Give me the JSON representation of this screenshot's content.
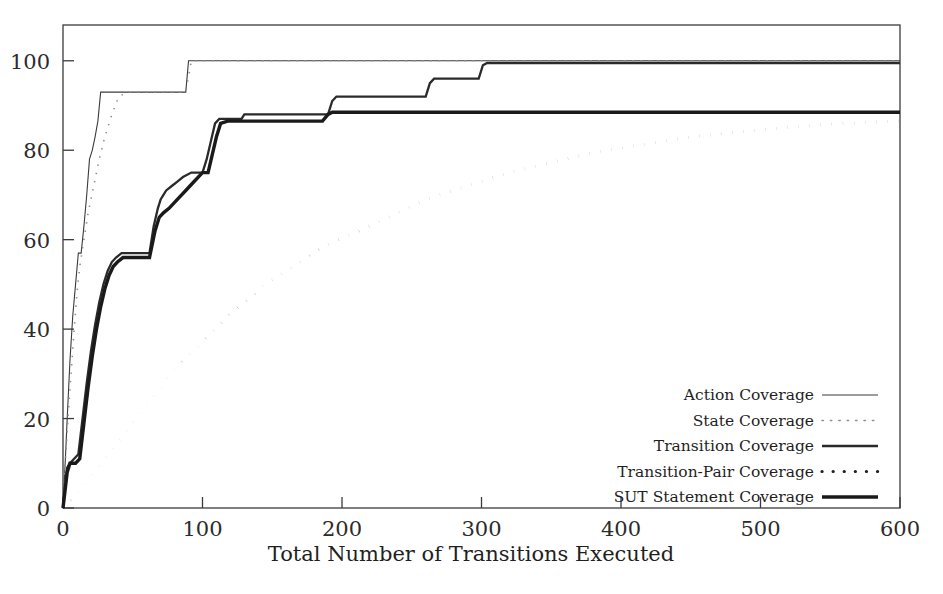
{
  "chart_data": {
    "type": "line",
    "title": "",
    "xlabel": "Total Number of Transitions Executed",
    "ylabel": "",
    "xlim": [
      0,
      600
    ],
    "ylim": [
      0,
      108
    ],
    "xticks": [
      0,
      100,
      200,
      300,
      400,
      500,
      600
    ],
    "yticks": [
      0,
      20,
      40,
      60,
      80,
      100
    ],
    "xtick_labels": [
      "0",
      "100",
      "200",
      "300",
      "400",
      "500",
      "600"
    ],
    "ytick_labels": [
      "0",
      "20",
      "40",
      "60",
      "80",
      "100"
    ],
    "grid": false,
    "legend_position": "lower-right",
    "series": [
      {
        "name": "Action Coverage",
        "style": "thin-solid",
        "color": "#3b3b3b",
        "width": 1.1,
        "dash": "",
        "points": [
          [
            0,
            0
          ],
          [
            2,
            13
          ],
          [
            3,
            20
          ],
          [
            5,
            33
          ],
          [
            7,
            43
          ],
          [
            9,
            50
          ],
          [
            11,
            57
          ],
          [
            13,
            57
          ],
          [
            15,
            63
          ],
          [
            17,
            70
          ],
          [
            19,
            78
          ],
          [
            21,
            80
          ],
          [
            23,
            83
          ],
          [
            25,
            86.5
          ],
          [
            27,
            93
          ],
          [
            88,
            93
          ],
          [
            90,
            100
          ],
          [
            600,
            100
          ]
        ]
      },
      {
        "name": "State Coverage",
        "style": "fine-dotted",
        "color": "#8f8f8f",
        "width": 1.6,
        "dash": "1.4 7",
        "points": [
          [
            0,
            0
          ],
          [
            2,
            12
          ],
          [
            4,
            22
          ],
          [
            6,
            31
          ],
          [
            8,
            40
          ],
          [
            10,
            48
          ],
          [
            12,
            54
          ],
          [
            15,
            60
          ],
          [
            18,
            66
          ],
          [
            22,
            72
          ],
          [
            26,
            78
          ],
          [
            30,
            83
          ],
          [
            35,
            88
          ],
          [
            40,
            92
          ],
          [
            46,
            93
          ],
          [
            88,
            93
          ],
          [
            92,
            100
          ],
          [
            600,
            100
          ]
        ]
      },
      {
        "name": "Transition Coverage",
        "style": "medium-solid",
        "color": "#2a2a2a",
        "width": 2.3,
        "dash": "",
        "points": [
          [
            0,
            0
          ],
          [
            3,
            9
          ],
          [
            5,
            10
          ],
          [
            8,
            11
          ],
          [
            11,
            12
          ],
          [
            14,
            20
          ],
          [
            17,
            28
          ],
          [
            20,
            35
          ],
          [
            23,
            41
          ],
          [
            26,
            46
          ],
          [
            29,
            50
          ],
          [
            32,
            53
          ],
          [
            35,
            55
          ],
          [
            38,
            56
          ],
          [
            42,
            57
          ],
          [
            62,
            57
          ],
          [
            65,
            63
          ],
          [
            68,
            67
          ],
          [
            70,
            69
          ],
          [
            72,
            70
          ],
          [
            74,
            71
          ],
          [
            78,
            72
          ],
          [
            82,
            73
          ],
          [
            86,
            74
          ],
          [
            92,
            75
          ],
          [
            100,
            75
          ],
          [
            103,
            78
          ],
          [
            106,
            82
          ],
          [
            109,
            86
          ],
          [
            112,
            87
          ],
          [
            128,
            87
          ],
          [
            130,
            88
          ],
          [
            190,
            88
          ],
          [
            193,
            91
          ],
          [
            196,
            92
          ],
          [
            260,
            92
          ],
          [
            263,
            95
          ],
          [
            266,
            96
          ],
          [
            298,
            96
          ],
          [
            301,
            99
          ],
          [
            304,
            99.5
          ],
          [
            600,
            99.5
          ]
        ]
      },
      {
        "name": "Transition-Pair Coverage",
        "style": "coarse-dotted",
        "color": "#1f1f1f",
        "width": 3.2,
        "dash": "0.1 11",
        "points": [
          [
            0,
            0
          ],
          [
            10,
            3
          ],
          [
            20,
            7
          ],
          [
            30,
            11
          ],
          [
            40,
            15
          ],
          [
            50,
            19
          ],
          [
            60,
            23
          ],
          [
            70,
            27
          ],
          [
            80,
            31
          ],
          [
            90,
            34
          ],
          [
            100,
            37
          ],
          [
            115,
            42
          ],
          [
            130,
            46
          ],
          [
            145,
            50
          ],
          [
            160,
            53
          ],
          [
            175,
            56
          ],
          [
            190,
            59
          ],
          [
            205,
            61
          ],
          [
            220,
            63
          ],
          [
            240,
            66
          ],
          [
            260,
            69
          ],
          [
            280,
            71
          ],
          [
            300,
            73
          ],
          [
            320,
            75
          ],
          [
            340,
            76.5
          ],
          [
            360,
            78
          ],
          [
            380,
            79.5
          ],
          [
            400,
            80.5
          ],
          [
            420,
            81.5
          ],
          [
            440,
            82.5
          ],
          [
            460,
            83.3
          ],
          [
            480,
            84
          ],
          [
            500,
            84.6
          ],
          [
            520,
            85.1
          ],
          [
            540,
            85.6
          ],
          [
            560,
            86
          ],
          [
            580,
            86.3
          ],
          [
            600,
            86.5
          ]
        ]
      },
      {
        "name": "SUT Statement Coverage",
        "style": "thick-solid",
        "color": "#1a1a1a",
        "width": 3.4,
        "dash": "",
        "points": [
          [
            0,
            0
          ],
          [
            3,
            8
          ],
          [
            5,
            10
          ],
          [
            9,
            10
          ],
          [
            12,
            11
          ],
          [
            15,
            19
          ],
          [
            18,
            27
          ],
          [
            21,
            34
          ],
          [
            24,
            40
          ],
          [
            27,
            45
          ],
          [
            30,
            49
          ],
          [
            33,
            52
          ],
          [
            36,
            54
          ],
          [
            39,
            55
          ],
          [
            43,
            56
          ],
          [
            62,
            56
          ],
          [
            66,
            62
          ],
          [
            69,
            65
          ],
          [
            72,
            66
          ],
          [
            76,
            67
          ],
          [
            82,
            69
          ],
          [
            88,
            71
          ],
          [
            94,
            73
          ],
          [
            100,
            75
          ],
          [
            104,
            75
          ],
          [
            107,
            79
          ],
          [
            110,
            83
          ],
          [
            113,
            86
          ],
          [
            118,
            86.5
          ],
          [
            186,
            86.5
          ],
          [
            190,
            88
          ],
          [
            193,
            88.5
          ],
          [
            600,
            88.5
          ]
        ]
      }
    ]
  },
  "legend": {
    "entries": [
      {
        "label": "Action Coverage",
        "sample": "thin-solid"
      },
      {
        "label": "State Coverage",
        "sample": "fine-dotted"
      },
      {
        "label": "Transition Coverage",
        "sample": "medium-solid"
      },
      {
        "label": "Transition-Pair Coverage",
        "sample": "coarse-dotted"
      },
      {
        "label": "SUT Statement Coverage",
        "sample": "thick-solid"
      }
    ]
  },
  "colors": {
    "background": "#ffffff",
    "frame": "#3b3b3b",
    "text": "#1f1f1f",
    "state_coverage": "#8f8f8f"
  }
}
